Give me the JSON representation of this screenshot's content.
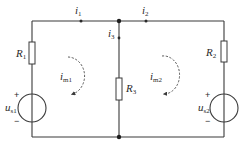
{
  "diagram": {
    "type": "circuit",
    "colors": {
      "line": "#3a3a3a",
      "text": "#2a2a2a",
      "background": "#ffffff"
    },
    "currents": [
      {
        "id": "i1",
        "symbol": "i",
        "sub": "1",
        "direction": "right"
      },
      {
        "id": "i2",
        "symbol": "i",
        "sub": "2",
        "direction": "right"
      },
      {
        "id": "i3",
        "symbol": "i",
        "sub": "3",
        "direction": "down"
      }
    ],
    "resistors": [
      {
        "id": "R1",
        "symbol": "R",
        "sub": "1"
      },
      {
        "id": "R2",
        "symbol": "R",
        "sub": "2"
      },
      {
        "id": "R3",
        "symbol": "R",
        "sub": "3"
      }
    ],
    "sources": [
      {
        "id": "us1",
        "symbol": "u",
        "sub": "s1",
        "plus": "+",
        "minus": "−"
      },
      {
        "id": "us2",
        "symbol": "u",
        "sub": "s2",
        "plus": "+",
        "minus": "−"
      }
    ],
    "meshes": [
      {
        "id": "im1",
        "symbol": "i",
        "sub": "m1",
        "direction": "clockwise"
      },
      {
        "id": "im2",
        "symbol": "i",
        "sub": "m2",
        "direction": "clockwise"
      }
    ]
  }
}
